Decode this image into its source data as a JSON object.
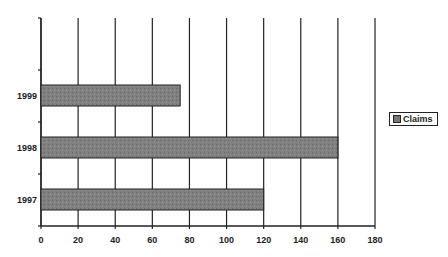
{
  "chart_data": {
    "type": "bar",
    "orientation": "horizontal",
    "title": "",
    "xlabel": "",
    "ylabel": "",
    "categories": [
      "1997",
      "1998",
      "1999"
    ],
    "series": [
      {
        "name": "Claims",
        "values": [
          120,
          160,
          75
        ],
        "color": "#7a7a7a"
      }
    ],
    "xlim": [
      0,
      180
    ],
    "x_ticks": [
      0,
      20,
      40,
      60,
      80,
      100,
      120,
      140,
      160,
      180
    ],
    "grid": {
      "vertical": true,
      "horizontal": false
    },
    "legend": {
      "position": "right",
      "entries": [
        "Claims"
      ]
    }
  },
  "legend": {
    "label": "Claims"
  }
}
